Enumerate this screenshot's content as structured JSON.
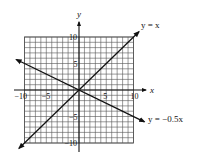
{
  "chart_data": {
    "type": "line",
    "title": "",
    "xlabel": "x",
    "ylabel": "y",
    "xlim": [
      -10,
      10
    ],
    "ylim": [
      -10,
      10
    ],
    "grid": true,
    "grid_step": 1,
    "x_tick_labels": [
      "−10",
      "−5",
      "5",
      "10"
    ],
    "x_tick_values": [
      -10,
      -5,
      5,
      10
    ],
    "y_tick_labels": [
      "10",
      "5",
      "−5",
      "−10"
    ],
    "y_tick_values": [
      10,
      5,
      -5,
      -10
    ],
    "series": [
      {
        "name": "y = x",
        "slope": 1,
        "intercept": 0,
        "x": [
          -11,
          11
        ],
        "y": [
          -11,
          11
        ]
      },
      {
        "name": "y = −0.5x",
        "slope": -0.5,
        "intercept": 0,
        "x": [
          -11.5,
          12
        ],
        "y": [
          5.75,
          -6
        ]
      }
    ],
    "annotations": [
      {
        "text": "y = x",
        "near": "upper-right end of line y=x"
      },
      {
        "text": "y = −0.5x",
        "near": "lower-right end of line y=-0.5x"
      }
    ],
    "legend": "none (lines labeled inline)"
  }
}
